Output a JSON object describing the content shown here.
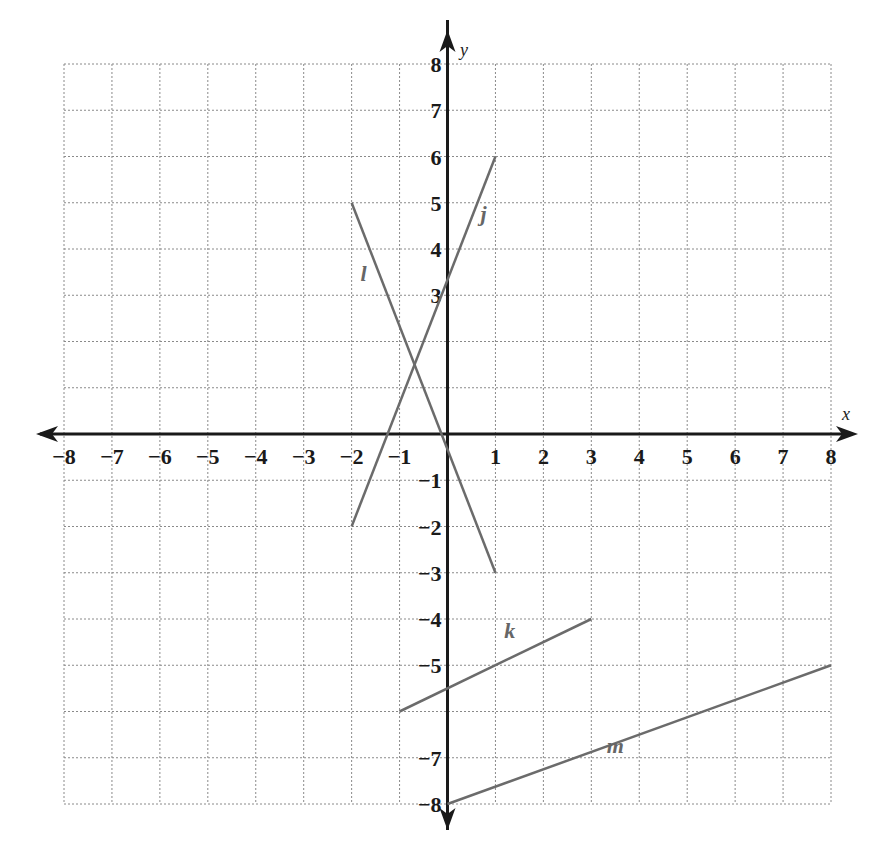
{
  "chart_data": {
    "type": "line",
    "title": "",
    "xlabel": "x",
    "ylabel": "y",
    "xlim": [
      -8,
      8
    ],
    "ylim": [
      -8,
      8
    ],
    "grid": true,
    "legend": "none",
    "x_tick_labels": [
      "-8",
      "-7",
      "-6",
      "-5",
      "-4",
      "-3",
      "-2",
      "-1",
      "1",
      "2",
      "3",
      "4",
      "5",
      "6",
      "7",
      "8"
    ],
    "y_tick_labels": [
      "8",
      "7",
      "6",
      "5",
      "4",
      "3",
      "-1",
      "-2",
      "-3",
      "-4",
      "-5",
      "-7",
      "-8"
    ],
    "series": [
      {
        "name": "j",
        "points": [
          [
            -2,
            -2
          ],
          [
            1,
            6
          ]
        ]
      },
      {
        "name": "l",
        "points": [
          [
            -2,
            5
          ],
          [
            1,
            -3
          ]
        ]
      },
      {
        "name": "k",
        "points": [
          [
            -1,
            -6
          ],
          [
            3,
            -4
          ]
        ]
      },
      {
        "name": "m",
        "points": [
          [
            0,
            -8
          ],
          [
            8,
            -5
          ]
        ]
      }
    ],
    "annotations": [
      {
        "text": "j",
        "x": 0.75,
        "y": 4.6
      },
      {
        "text": "l",
        "x": -1.75,
        "y": 3.3
      },
      {
        "text": "k",
        "x": 1.3,
        "y": -4.4
      },
      {
        "text": "m",
        "x": 3.5,
        "y": -6.9
      }
    ]
  },
  "style": {
    "grid_color": "#8a8a8a",
    "axis_color": "#1a1a1a",
    "line_color": "#6b6b6b",
    "label_color": "#666666"
  }
}
